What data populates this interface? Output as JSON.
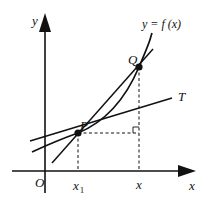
{
  "diagram": {
    "type": "calculus-secant-tangent",
    "labels": {
      "y_axis": "y",
      "x_axis": "x",
      "origin": "O",
      "function": "y = f (x)",
      "point_p": "P",
      "point_q": "Q",
      "tangent": "T",
      "x1_main": "x",
      "x1_sub": "1",
      "x_point": "x"
    },
    "colors": {
      "stroke": "#111111",
      "background": "#ffffff"
    },
    "elements": [
      "x-axis with arrow",
      "y-axis with arrow",
      "curve y=f(x)",
      "secant line PQ",
      "tangent line T at P",
      "dashed projection from P to x1",
      "dashed projection from Q to x",
      "dashed horizontal from P",
      "right-angle marker"
    ]
  }
}
